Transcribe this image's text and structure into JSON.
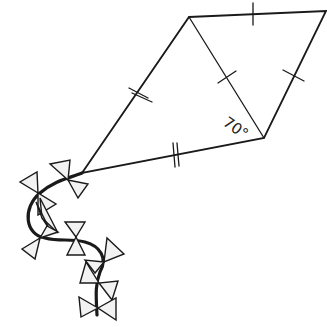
{
  "diagram": {
    "type": "kite-geometry",
    "angle_label": "70°",
    "stroke_color": "#1a1a1a",
    "bow_fill": "#f2f2f2",
    "vertices": {
      "top": [
        189,
        17
      ],
      "right": [
        326,
        11
      ],
      "bottom": [
        264,
        138
      ],
      "left": [
        82,
        173
      ]
    },
    "marks": {
      "single_tick_sides": [
        "top-right",
        "right-bottom",
        "top-bottom diagonal"
      ],
      "double_tick_sides": [
        "top-left",
        "left-bottom"
      ]
    }
  }
}
